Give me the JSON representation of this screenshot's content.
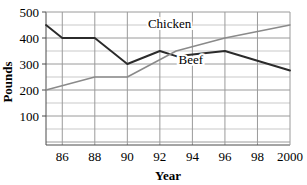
{
  "chart_data": {
    "type": "line",
    "title": "",
    "xlabel": "Year",
    "ylabel": "Pounds",
    "xlim": [
      1985,
      2000
    ],
    "ylim": [
      0,
      500
    ],
    "grid": true,
    "legend_position": "inline-labels",
    "x_tick_labels": [
      "86",
      "88",
      "90",
      "92",
      "94",
      "96",
      "98",
      "2000"
    ],
    "x_tick_values": [
      1986,
      1988,
      1990,
      1992,
      1994,
      1996,
      1998,
      2000
    ],
    "y_tick_labels": [
      "100",
      "200",
      "300",
      "400",
      "500"
    ],
    "y_tick_values": [
      100,
      200,
      300,
      400,
      500
    ],
    "y_minor_step": 50,
    "series": [
      {
        "name": "Beef",
        "color": "#2b2b2b",
        "label_x": 1993.9,
        "label_y": 300,
        "x": [
          1985,
          1986,
          1988,
          1990,
          1992,
          1993,
          1996,
          2000
        ],
        "values": [
          450,
          400,
          400,
          300,
          350,
          330,
          350,
          275
        ]
      },
      {
        "name": "Chicken",
        "color": "#8a8a8a",
        "label_x": 1992.6,
        "label_y": 440,
        "x": [
          1985,
          1988,
          1990,
          1993,
          1996,
          2000
        ],
        "values": [
          200,
          250,
          250,
          350,
          400,
          450
        ]
      }
    ]
  },
  "axes": {
    "y_axis_title": "Pounds",
    "x_axis_title": "Year"
  }
}
